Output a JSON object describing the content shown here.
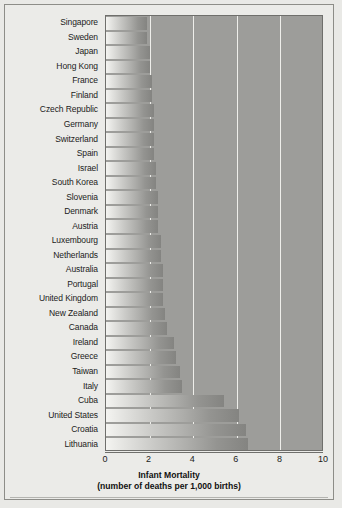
{
  "chart_data": {
    "type": "bar",
    "orientation": "horizontal",
    "title": "Infant Mortality",
    "subtitle": "(number of deaths per 1,000 births)",
    "xlabel": "Infant Mortality",
    "ylabel": "",
    "xlim": [
      0,
      10
    ],
    "xticks": [
      "0",
      "2",
      "4",
      "6",
      "8",
      "10"
    ],
    "xtick_values": [
      0,
      2,
      4,
      6,
      8,
      10
    ],
    "gridlines": [
      2,
      4,
      6,
      8
    ],
    "grid": true,
    "legend": "none",
    "categories": [
      "Singapore",
      "Sweden",
      "Japan",
      "Hong Kong",
      "France",
      "Finland",
      "Czech Republic",
      "Germany",
      "Switzerland",
      "Spain",
      "Israel",
      "South Korea",
      "Slovenia",
      "Denmark",
      "Austria",
      "Luxembourg",
      "Netherlands",
      "Australia",
      "Portugal",
      "United Kingdom",
      "New Zealand",
      "Canada",
      "Ireland",
      "Greece",
      "Taiwan",
      "Italy",
      "Cuba",
      "United States",
      "Croatia",
      "Lithuania"
    ],
    "values": [
      1.9,
      1.9,
      2.0,
      2.0,
      2.1,
      2.1,
      2.2,
      2.2,
      2.2,
      2.2,
      2.3,
      2.3,
      2.4,
      2.4,
      2.4,
      2.5,
      2.5,
      2.6,
      2.6,
      2.6,
      2.7,
      2.8,
      3.1,
      3.2,
      3.4,
      3.5,
      5.4,
      6.1,
      6.4,
      6.5
    ]
  },
  "axis": {
    "x_title_line1": "Infant Mortality",
    "x_title_line2": "(number of deaths per 1,000 births)"
  },
  "colors": {
    "plot_background": "#9d9d9a",
    "page_background": "#e9e9e6",
    "gridline": "#eeeeea",
    "bar_light": "#f4f4f1",
    "bar_dark": "#848481",
    "frame": "#8d8d88",
    "text": "#1b1b1b"
  }
}
